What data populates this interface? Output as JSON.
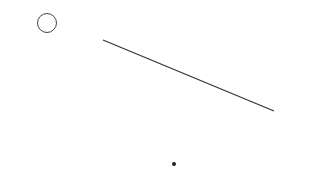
{
  "problem": {
    "number_label": "4",
    "segment_label": "ア",
    "point_label": "イ"
  },
  "geometry": {
    "segment": {
      "x1": 103,
      "y1": 40,
      "x2": 274,
      "y2": 111
    },
    "point": {
      "x": 174,
      "y": 164
    },
    "line_color": "#333333",
    "grid_dot_dark": "#b8b8b8",
    "grid_dot_light": "#dedede"
  }
}
